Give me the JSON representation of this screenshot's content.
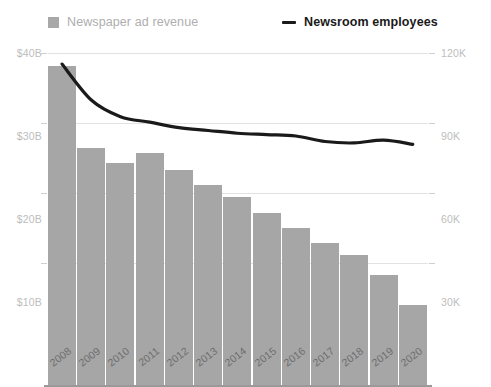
{
  "legend": {
    "bars": {
      "label": "Newspaper ad revenue",
      "swatch_color": "#a8a8a8",
      "icon": "square-swatch-icon"
    },
    "line": {
      "label": "Newsroom employees",
      "line_color": "#1a1a1a",
      "icon": "dash-line-icon"
    }
  },
  "axes": {
    "left": {
      "ticks": [
        "$40B",
        "$30B",
        "$20B",
        "$10B"
      ],
      "values": [
        40,
        30,
        20,
        10
      ],
      "color": "#bdbdbd"
    },
    "right": {
      "ticks": [
        "120K",
        "90K",
        "60K",
        "30K"
      ],
      "values": [
        120,
        90,
        60,
        30
      ],
      "color": "#bdbdbd"
    },
    "x": {
      "ticks": [
        "2008",
        "2009",
        "2010",
        "2011",
        "2012",
        "2013",
        "2014",
        "2015",
        "2016",
        "2017",
        "2018",
        "2019",
        "2020"
      ],
      "color": "#6e6e6e"
    }
  },
  "chart_data": {
    "type": "bar",
    "title": "",
    "subtitle": "",
    "xlabel": "",
    "ylabel": "Newspaper ad revenue",
    "y2label": "Newsroom employees",
    "categories": [
      "2008",
      "2009",
      "2010",
      "2011",
      "2012",
      "2013",
      "2014",
      "2015",
      "2016",
      "2017",
      "2018",
      "2019",
      "2020"
    ],
    "ylim": [
      0,
      40
    ],
    "y2lim": [
      0,
      120
    ],
    "grid": true,
    "legend_position": "top",
    "series": [
      {
        "name": "Newspaper ad revenue",
        "type": "bar",
        "axis": "left",
        "unit": "billion USD",
        "color": "#a6a6a6",
        "values": [
          38.4,
          28.6,
          26.7,
          27.9,
          25.9,
          24.1,
          22.7,
          20.7,
          18.9,
          17.1,
          15.7,
          13.3,
          9.7
        ]
      },
      {
        "name": "Newsroom employees",
        "type": "line",
        "axis": "right",
        "unit": "thousand employees",
        "color": "#1a1a1a",
        "values": [
          116,
          103,
          97,
          95,
          93,
          92,
          91,
          90.5,
          90,
          88,
          87.5,
          88.5,
          87
        ]
      }
    ]
  }
}
